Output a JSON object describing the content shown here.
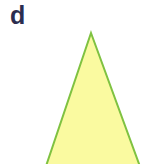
{
  "panel": {
    "label": "d",
    "label_color": "#2b2d4f",
    "background_color": "#ffffff",
    "width": 161,
    "height": 164
  },
  "shape": {
    "name": "triangle",
    "kind": "isosceles-triangle",
    "fill_color": "#fafaa0",
    "stroke_color": "#7fc241",
    "stroke_width": 2,
    "points": "91,33 142,172 44,172",
    "apex": {
      "x": 91,
      "y": 33
    },
    "base_left": {
      "x": 44,
      "y": 172
    },
    "base_right": {
      "x": 142,
      "y": 172
    },
    "clipped_at_bottom": true
  }
}
